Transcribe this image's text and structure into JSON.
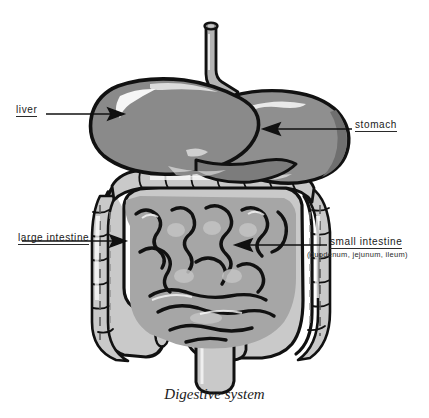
{
  "figure": {
    "caption": "Digestive system",
    "background_color": "#ffffff",
    "outline_color": "#111111",
    "palette": {
      "liver": "#8a8a8a",
      "stomach": "#8f8f8f",
      "esophagus": "#b4b4b4",
      "large_intestine": "#c9c9c9",
      "small_intestine": "#a6a6a6",
      "highlight": "#ffffff",
      "shadow": "#6f6f6f"
    }
  },
  "labels": {
    "liver": {
      "text": "liver",
      "underlined": true,
      "leader_line": {
        "from_x": 46,
        "to_x": 122,
        "y": 114,
        "arrow": "right"
      }
    },
    "stomach": {
      "text": "stomach",
      "underlined": true,
      "leader_line": {
        "from_x": 352,
        "to_x": 265,
        "y": 129,
        "arrow": "left"
      }
    },
    "large_intestine": {
      "text": "large intestine",
      "underlined": true,
      "leader_line": {
        "from_x": 96,
        "to_x": 124,
        "y": 241,
        "arrow": "right"
      }
    },
    "small_intestine": {
      "text": "small intestine",
      "underlined": true,
      "sub_text": "(duodenum, jejunum, ileum)",
      "leader_line": {
        "from_x": 327,
        "to_x": 236,
        "y": 245,
        "arrow": "left"
      }
    }
  },
  "organs": [
    {
      "name": "esophagus",
      "label": "esophagus"
    },
    {
      "name": "liver",
      "label": "liver"
    },
    {
      "name": "stomach",
      "label": "stomach"
    },
    {
      "name": "large-intestine",
      "label": "large intestine"
    },
    {
      "name": "small-intestine",
      "label": "small intestine"
    },
    {
      "name": "rectum",
      "label": "rectum"
    },
    {
      "name": "appendix",
      "label": "appendix"
    }
  ]
}
